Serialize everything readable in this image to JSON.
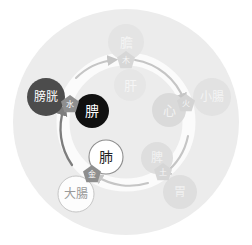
{
  "diagram": {
    "colors": {
      "background": "#ffffff",
      "outer_disc": "#ebebeb",
      "ring": "#fbfbfb",
      "arrow": "#c9c9c9",
      "arrow_active": "#7d7d7d",
      "pentagon_dim": "#d5d5d5",
      "pentagon_active": "#8f8f8f",
      "zang_dim": "#e0e0e0",
      "zang_active": "#111111",
      "fu_dim": "#dcdcdc",
      "fu_active": "#4a4a4a",
      "highlight_white": "#ffffff",
      "text_dim": "#f2f2f2",
      "text_active": "#ffffff",
      "text_dark": "#555555"
    }
  },
  "elements": [
    {
      "name": "water-pentagon",
      "label": "水",
      "state": "active"
    },
    {
      "name": "wood-pentagon",
      "label": "木",
      "state": "dim"
    },
    {
      "name": "fire-pentagon",
      "label": "火",
      "state": "dim"
    },
    {
      "name": "earth-pentagon",
      "label": "土",
      "state": "dim"
    },
    {
      "name": "metal-pentagon",
      "label": "金",
      "state": "active"
    }
  ],
  "zang_organs": [
    {
      "name": "kidney-circle",
      "label": "腗",
      "state": "active"
    },
    {
      "name": "liver-circle",
      "label": "肝",
      "state": "dim"
    },
    {
      "name": "heart-circle",
      "label": "心",
      "state": "dim"
    },
    {
      "name": "spleen-circle",
      "label": "脾",
      "state": "dim"
    },
    {
      "name": "lung-circle",
      "label": "肺",
      "state": "outline"
    }
  ],
  "fu_organs": [
    {
      "name": "bladder-circle",
      "label": "膀胱",
      "state": "active"
    },
    {
      "name": "gallbladder-circle",
      "label": "膽",
      "state": "dim"
    },
    {
      "name": "small-intestine-circle",
      "label": "小腸",
      "state": "dim"
    },
    {
      "name": "stomach-circle",
      "label": "胃",
      "state": "dim"
    },
    {
      "name": "large-intestine-circle",
      "label": "大腸",
      "state": "outline"
    }
  ]
}
